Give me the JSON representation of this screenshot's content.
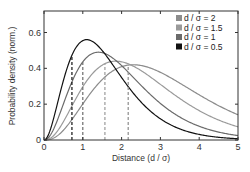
{
  "chart_data": {
    "type": "line",
    "title": "",
    "xlabel": "Distance (d / σ)",
    "ylabel": "Probability density (norm.)",
    "xlim": [
      0,
      5
    ],
    "ylim": [
      0,
      0.72
    ],
    "xticks": [
      0,
      1,
      2,
      3,
      4,
      5
    ],
    "yticks": [
      0,
      0.2,
      0.4,
      0.6
    ],
    "xtick_labels": [
      "0",
      "1",
      "2",
      "3",
      "4",
      "5"
    ],
    "ytick_labels": [
      "0",
      "0.2",
      "0.4",
      "0.6"
    ],
    "grid": false,
    "legend_position": "upper right",
    "series": [
      {
        "name": "d / σ = 2",
        "color": "#8c8c8c",
        "sigma_ratio": 2,
        "peak_x": 2.3,
        "peak_y": 0.42,
        "marker_x": 2.17
      },
      {
        "name": "d / σ = 1.5",
        "color": "#9a9a9a",
        "sigma_ratio": 1.5,
        "peak_x": 1.85,
        "peak_y": 0.44,
        "marker_x": 1.57
      },
      {
        "name": "d / σ = 1",
        "color": "#6b6b6b",
        "sigma_ratio": 1,
        "peak_x": 1.4,
        "peak_y": 0.49,
        "marker_x": 1.0
      },
      {
        "name": "d / σ = 0.5",
        "color": "#111111",
        "sigma_ratio": 0.5,
        "peak_x": 1.1,
        "peak_y": 0.56,
        "marker_x": 0.72
      }
    ]
  },
  "axes": {
    "xlabel": "Distance (d / σ)",
    "ylabel": "Probability density (norm.)"
  },
  "legend": [
    {
      "label": "d / σ = 2",
      "color": "#8c8c8c"
    },
    {
      "label": "d / σ = 1.5",
      "color": "#9a9a9a"
    },
    {
      "label": "d / σ = 1",
      "color": "#6b6b6b"
    },
    {
      "label": "d / σ = 0.5",
      "color": "#111111"
    }
  ]
}
